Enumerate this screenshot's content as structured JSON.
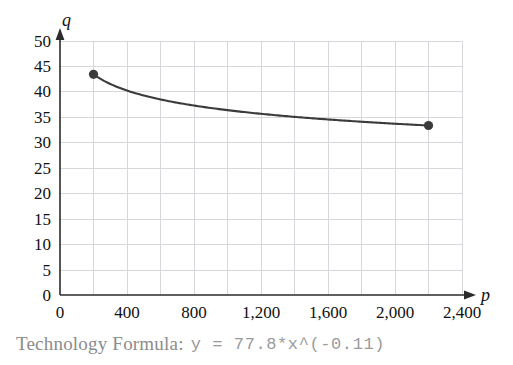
{
  "caption": {
    "label": "Technology Formula:",
    "formula": "y = 77.8*x^(-0.11)"
  },
  "chart_data": {
    "type": "line",
    "title": "",
    "xlabel": "p",
    "ylabel": "q",
    "xlim": [
      0,
      2400
    ],
    "ylim": [
      0,
      50
    ],
    "grid": true,
    "legend": "none",
    "equation": "y = 77.8*x^(-0.11)",
    "coefficient": 77.8,
    "exponent": -0.11,
    "x_major_ticks": [
      0,
      400,
      800,
      1200,
      1600,
      2000,
      2400
    ],
    "x_tick_labels": [
      "0",
      "400",
      "800",
      "1,200",
      "1,600",
      "2,000",
      "2,400"
    ],
    "x_minor_gridlines": [
      200,
      600,
      1000,
      1400,
      1800,
      2200
    ],
    "y_ticks": [
      0,
      5,
      10,
      15,
      20,
      25,
      30,
      35,
      40,
      45,
      50
    ],
    "y_tick_labels": [
      "0",
      "5",
      "10",
      "15",
      "20",
      "25",
      "30",
      "35",
      "40",
      "45",
      "50"
    ],
    "x": [
      200,
      300,
      400,
      500,
      600,
      700,
      800,
      900,
      1000,
      1100,
      1200,
      1300,
      1400,
      1500,
      1600,
      1700,
      1800,
      1900,
      2000,
      2100,
      2200
    ],
    "y": [
      43.0,
      41.2,
      39.8,
      38.8,
      38.0,
      37.3,
      36.8,
      36.3,
      35.8,
      35.4,
      35.1,
      34.8,
      34.5,
      34.2,
      34.0,
      33.8,
      33.6,
      33.4,
      33.2,
      33.0,
      33.4
    ],
    "markers": [
      {
        "x": 200,
        "y": 43.0
      },
      {
        "x": 2200,
        "y": 33.4
      }
    ],
    "curve_color": "#3b3b3b",
    "grid_color": "#d7d7dc",
    "axis_color": "#2b2b2b"
  }
}
